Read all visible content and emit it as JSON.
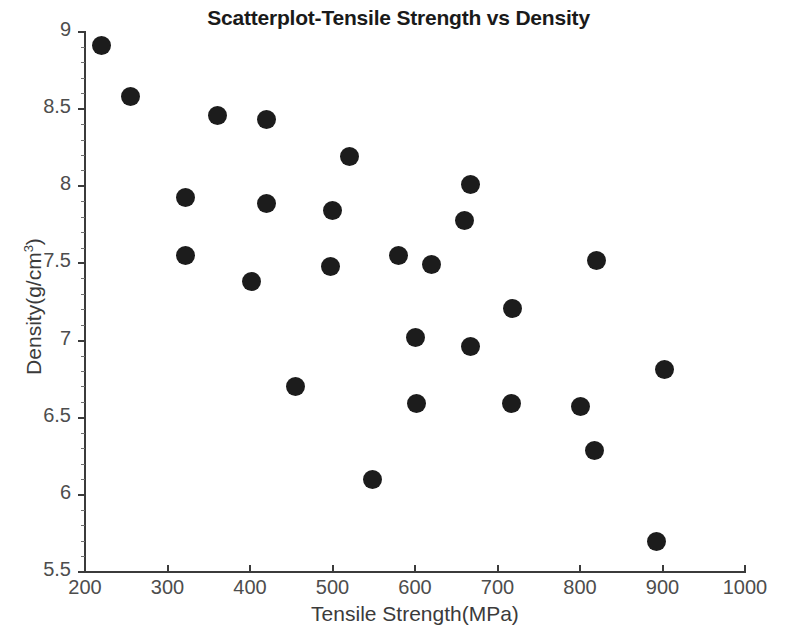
{
  "chart_data": {
    "type": "scatter",
    "title": "Scatterplot-Tensile Strength vs Density",
    "xlabel": "Tensile Strength(MPa)",
    "ylabel_text": "Density(g/cm",
    "ylabel_sup": "3",
    "ylabel_tail": ")",
    "ylabel_full": "Density(g/cm³)",
    "xlim": [
      200,
      1000
    ],
    "ylim": [
      5.5,
      9
    ],
    "xticks": [
      200,
      300,
      400,
      500,
      600,
      700,
      800,
      900,
      1000
    ],
    "yticks": [
      5.5,
      6,
      6.5,
      7,
      7.5,
      8,
      8.5,
      9
    ],
    "xtick_labels": [
      "200",
      "300",
      "400",
      "500",
      "600",
      "700",
      "800",
      "900",
      "1000"
    ],
    "ytick_labels": [
      "5.5",
      "6",
      "6.5",
      "7",
      "7.5",
      "8",
      "8.5",
      "9"
    ],
    "grid": false,
    "legend": false,
    "marker": "filled-circle",
    "marker_color": "#1c1c1c",
    "marker_size_px": 19,
    "background_color": "#ffffff",
    "axis_color": "#3b3b3b",
    "n_points": 26,
    "x": [
      220,
      255,
      322,
      360,
      402,
      420,
      455,
      497,
      500,
      520,
      548,
      580,
      600,
      602,
      620,
      660,
      667,
      667,
      718,
      717,
      800,
      818,
      820,
      893,
      903,
      322
    ],
    "y": [
      8.91,
      8.58,
      7.93,
      8.46,
      7.38,
      8.43,
      6.7,
      7.48,
      7.84,
      8.19,
      6.1,
      7.55,
      7.02,
      6.59,
      7.49,
      7.78,
      8.01,
      6.96,
      7.21,
      6.59,
      6.57,
      6.29,
      7.52,
      5.7,
      6.81,
      7.55
    ],
    "points": [
      {
        "x": 220,
        "y": 8.91
      },
      {
        "x": 255,
        "y": 8.58
      },
      {
        "x": 322,
        "y": 7.93
      },
      {
        "x": 322,
        "y": 7.55
      },
      {
        "x": 360,
        "y": 8.46
      },
      {
        "x": 402,
        "y": 7.38
      },
      {
        "x": 420,
        "y": 8.43
      },
      {
        "x": 420,
        "y": 7.89
      },
      {
        "x": 455,
        "y": 6.7
      },
      {
        "x": 497,
        "y": 7.48
      },
      {
        "x": 500,
        "y": 7.84
      },
      {
        "x": 520,
        "y": 8.19
      },
      {
        "x": 548,
        "y": 6.1
      },
      {
        "x": 580,
        "y": 7.55
      },
      {
        "x": 600,
        "y": 7.02
      },
      {
        "x": 602,
        "y": 6.59
      },
      {
        "x": 620,
        "y": 7.49
      },
      {
        "x": 660,
        "y": 7.78
      },
      {
        "x": 667,
        "y": 8.01
      },
      {
        "x": 667,
        "y": 6.96
      },
      {
        "x": 718,
        "y": 7.21
      },
      {
        "x": 717,
        "y": 6.59
      },
      {
        "x": 800,
        "y": 6.57
      },
      {
        "x": 818,
        "y": 6.29
      },
      {
        "x": 820,
        "y": 7.52
      },
      {
        "x": 893,
        "y": 5.7
      },
      {
        "x": 903,
        "y": 6.81
      }
    ]
  }
}
